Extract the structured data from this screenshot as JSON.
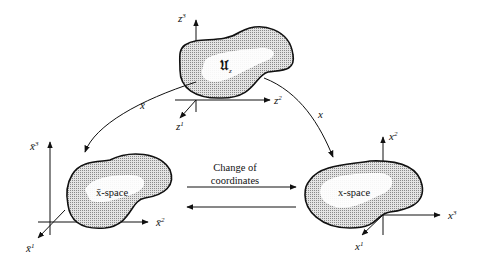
{
  "diagram": {
    "type": "coordinate-change-diagram",
    "regions": [
      {
        "id": "patch",
        "label": "𝔘",
        "label_sub": "z",
        "axes": [
          {
            "name": "z",
            "sup": "3"
          },
          {
            "name": "z",
            "sup": "2"
          },
          {
            "name": "z",
            "sup": "1"
          }
        ]
      },
      {
        "id": "xbar-space",
        "label": "x̄-space",
        "axes": [
          {
            "name": "x̄",
            "sup": "3"
          },
          {
            "name": "x̄",
            "sup": "2"
          },
          {
            "name": "x̄",
            "sup": "1"
          }
        ]
      },
      {
        "id": "x-space",
        "label": "x-space",
        "axes": [
          {
            "name": "x",
            "sup": "2"
          },
          {
            "name": "x",
            "sup": "3"
          },
          {
            "name": "x",
            "sup": "1"
          }
        ]
      }
    ],
    "maps": [
      {
        "from": "patch",
        "to": "xbar-space",
        "label": "x̄"
      },
      {
        "from": "patch",
        "to": "x-space",
        "label": "x"
      }
    ],
    "change_label_line1": "Change of",
    "change_label_line2": "coordinates"
  },
  "colors": {
    "ink": "#111111",
    "fill": "#b8b8b8",
    "background": "#ffffff"
  }
}
